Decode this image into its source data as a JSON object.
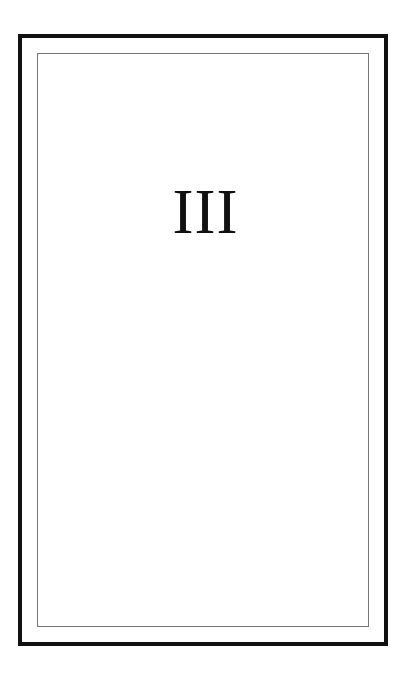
{
  "page": {
    "numeral": "III"
  },
  "colors": {
    "outer_border": "#111111",
    "inner_border": "#777777",
    "text": "#111111",
    "background": "#ffffff"
  }
}
